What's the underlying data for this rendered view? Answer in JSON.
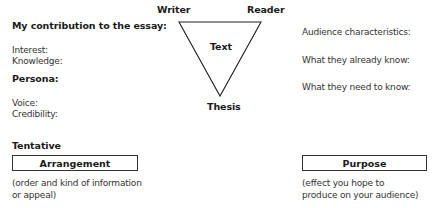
{
  "left": {
    "contribution_heading": "My contribution to the essay:",
    "interest_label": "Interest:",
    "knowledge_label": "Knowledge:",
    "persona_heading": "Persona:",
    "voice_label": "Voice:",
    "credibility_label": "Credibility:",
    "tentative_label": "Tentative",
    "arrangement_label": "Arrangement",
    "arrangement_note_line1": "(order and kind of information",
    "arrangement_note_line2": "or appeal)"
  },
  "triangle": {
    "top_left_label": "Writer",
    "top_right_label": "Reader",
    "center_label": "Text",
    "bottom_label": "Thesis"
  },
  "right": {
    "audience_characteristics_label": "Audience characteristics:",
    "already_know_label": "What they already know:",
    "need_to_know_label": "What they need to know:",
    "purpose_label": "Purpose",
    "purpose_note_line1": "(effect you hope to",
    "purpose_note_line2": "produce on your audience)"
  }
}
